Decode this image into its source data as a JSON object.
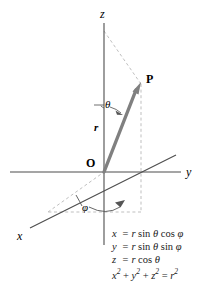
{
  "figure": {
    "background_color": "#ffffff",
    "axis_color": "#4d4d4d",
    "vector_color": "#808080",
    "dashed_color": "#b3b3b3",
    "text_color": "#000000"
  },
  "axes": [
    {
      "name": "z-axis",
      "label": "z",
      "direction": "up"
    },
    {
      "name": "y-axis",
      "label": "y",
      "direction": "right"
    },
    {
      "name": "x-axis",
      "label": "x",
      "direction": "down-left"
    }
  ],
  "points": [
    {
      "name": "origin",
      "label": "O"
    },
    {
      "name": "point-p",
      "label": "P"
    }
  ],
  "vector": {
    "name": "radius-vector",
    "label": "r"
  },
  "angles": [
    {
      "name": "theta",
      "label": "θ",
      "description": "polar angle from z-axis"
    },
    {
      "name": "phi",
      "label": "φ",
      "description": "azimuthal angle from x-axis"
    }
  ],
  "equations": [
    {
      "lhs": "x",
      "rel": "=",
      "rhs_pre": "r",
      "rhs_fn1": "sin",
      "rhs_a1": "θ",
      "rhs_fn2": "cos",
      "rhs_a2": "φ",
      "full": "x = r sin θ cos φ"
    },
    {
      "lhs": "y",
      "rel": "=",
      "rhs_pre": "r",
      "rhs_fn1": "sin",
      "rhs_a1": "θ",
      "rhs_fn2": "sin",
      "rhs_a2": "φ",
      "full": "y = r sin θ sin φ"
    },
    {
      "lhs": "z",
      "rel": "=",
      "rhs_pre": "r",
      "rhs_fn1": "cos",
      "rhs_a1": "θ",
      "rhs_fn2": "",
      "rhs_a2": "",
      "full": "z = r cos θ"
    }
  ],
  "identity": {
    "x": "x",
    "x_exp": "2",
    "y": "y",
    "y_exp": "2",
    "z": "z",
    "z_exp": "2",
    "r": "r",
    "r_exp": "2",
    "plus": "+",
    "eq": "=",
    "full": "x² + y² + z² = r²"
  }
}
